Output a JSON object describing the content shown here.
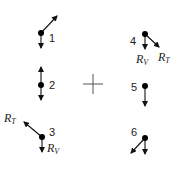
{
  "diagram": {
    "center_marker": {
      "x": 93,
      "y": 84,
      "size": 10
    },
    "points": [
      {
        "id": "1",
        "label": "1",
        "x": 41,
        "y": 33,
        "label_x": 49,
        "label_y": 42,
        "arrows": [
          {
            "to": [
              57,
              16
            ],
            "name": "outward"
          },
          {
            "to": [
              41,
              48
            ],
            "name": "down"
          }
        ],
        "vector_labels": []
      },
      {
        "id": "2",
        "label": "2",
        "x": 41,
        "y": 85,
        "label_x": 49,
        "label_y": 89,
        "arrows": [
          {
            "to": [
              41,
              67
            ],
            "name": "up"
          },
          {
            "to": [
              41,
              100
            ],
            "name": "down"
          }
        ],
        "vector_labels": []
      },
      {
        "id": "3",
        "label": "3",
        "x": 42,
        "y": 137,
        "label_x": 49,
        "label_y": 136,
        "arrows": [
          {
            "to": [
              24,
              122
            ],
            "name": "RT"
          },
          {
            "to": [
              42,
              152
            ],
            "name": "RV"
          }
        ],
        "vector_labels": [
          {
            "main": "R",
            "sub": "T",
            "x": 4,
            "y": 122
          },
          {
            "main": "R",
            "sub": "V",
            "x": 47,
            "y": 152
          }
        ]
      },
      {
        "id": "4",
        "label": "4",
        "x": 145,
        "y": 34,
        "label_x": 130,
        "label_y": 45,
        "arrows": [
          {
            "to": [
              145,
              49
            ],
            "name": "RV"
          },
          {
            "to": [
              159,
              47
            ],
            "name": "RT"
          }
        ],
        "vector_labels": [
          {
            "main": "R",
            "sub": "V",
            "x": 136,
            "y": 63
          },
          {
            "main": "R",
            "sub": "T",
            "x": 158,
            "y": 61
          }
        ]
      },
      {
        "id": "5",
        "label": "5",
        "x": 145,
        "y": 86,
        "label_x": 131,
        "label_y": 91,
        "arrows": [
          {
            "to": [
              145,
              106
            ],
            "name": "down"
          }
        ],
        "vector_labels": []
      },
      {
        "id": "6",
        "label": "6",
        "x": 145,
        "y": 138,
        "label_x": 131,
        "label_y": 136,
        "arrows": [
          {
            "to": [
              131,
              153
            ],
            "name": "outward"
          },
          {
            "to": [
              145,
              154
            ],
            "name": "down"
          }
        ],
        "vector_labels": []
      }
    ]
  }
}
